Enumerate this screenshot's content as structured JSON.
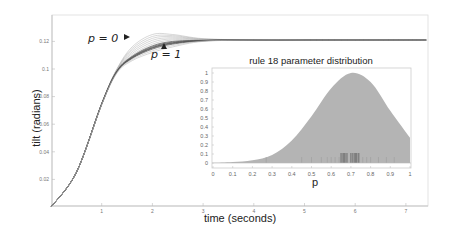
{
  "chart_data": [
    {
      "type": "line",
      "title": "",
      "xlabel": "time (seconds)",
      "ylabel": "tilt (radians)",
      "xlim": [
        0,
        7.4
      ],
      "ylim": [
        0,
        0.13
      ],
      "xticks": [
        "1",
        "2",
        "3",
        "4",
        "5",
        "6",
        "7"
      ],
      "yticks": [
        "0.02",
        "0.04",
        "0.06",
        "0.08",
        "0.1",
        "0.12"
      ],
      "grid": false,
      "annotations": [
        {
          "text": "p = 0",
          "marker": "right-pointing triangle",
          "x": 2.3,
          "y": 0.121
        },
        {
          "text": "p = 1",
          "marker": "up-pointing triangle",
          "x": 2.3,
          "y": 0.112
        }
      ],
      "series_description": "Family of step-response curves for parameter p from 0 to 1; rise from 0 at t=0 to ~0.1 at t~1.3, slight overshoot for p=0, settle near 0.121 by t~3",
      "series": [
        {
          "name": "p=0",
          "x": [
            0,
            0.5,
            1.0,
            1.3,
            1.6,
            2.0,
            2.4,
            3.0,
            4.0,
            5.0,
            6.0,
            7.4
          ],
          "values": [
            0,
            0.025,
            0.075,
            0.1,
            0.116,
            0.125,
            0.125,
            0.122,
            0.121,
            0.121,
            0.121,
            0.121
          ]
        },
        {
          "name": "p=0.5",
          "x": [
            0,
            0.5,
            1.0,
            1.3,
            1.6,
            2.0,
            2.4,
            3.0,
            4.0,
            5.0,
            6.0,
            7.4
          ],
          "values": [
            0,
            0.025,
            0.075,
            0.099,
            0.11,
            0.118,
            0.121,
            0.121,
            0.121,
            0.121,
            0.121,
            0.121
          ]
        },
        {
          "name": "p=1",
          "x": [
            0,
            0.5,
            1.0,
            1.3,
            1.6,
            2.0,
            2.4,
            3.0,
            4.0,
            5.0,
            6.0,
            7.4
          ],
          "values": [
            0,
            0.025,
            0.074,
            0.097,
            0.106,
            0.112,
            0.116,
            0.12,
            0.121,
            0.121,
            0.121,
            0.121
          ]
        }
      ]
    },
    {
      "type": "area",
      "title": "rule 18 parameter distribution",
      "xlabel": "p",
      "ylabel": "",
      "xlim": [
        0,
        1
      ],
      "ylim": [
        0,
        1.05
      ],
      "xticks": [
        "0",
        "0.1",
        "0.2",
        "0.3",
        "0.4",
        "0.5",
        "0.6",
        "0.7",
        "0.8",
        "0.9",
        "1"
      ],
      "yticks": [
        "0",
        "0.1",
        "0.2",
        "0.3",
        "0.4",
        "0.5",
        "0.6",
        "0.7",
        "0.8",
        "0.9",
        "1"
      ],
      "grid": false,
      "x": [
        0,
        0.1,
        0.2,
        0.3,
        0.4,
        0.5,
        0.6,
        0.7,
        0.8,
        0.9,
        1.0
      ],
      "values": [
        0.0,
        0.01,
        0.03,
        0.09,
        0.25,
        0.52,
        0.83,
        1.0,
        0.9,
        0.58,
        0.28
      ],
      "rug_marks_concentration": [
        0.66,
        0.72
      ]
    }
  ]
}
